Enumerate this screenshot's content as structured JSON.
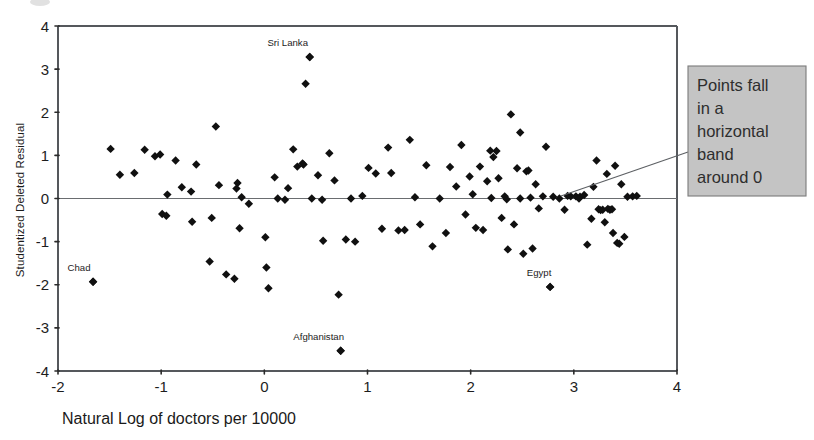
{
  "figure": {
    "background_color": "#ffffff",
    "plot_frame": {
      "left_px": 58,
      "right_px": 677,
      "top_px": 26,
      "bottom_px": 371
    }
  },
  "annotation": {
    "name": "callout-note",
    "lines": [
      "Points fall",
      "in a",
      "horizontal",
      "band",
      "around 0"
    ],
    "text": "Points fall in a horizontal band around 0",
    "box_fill": "#c4c4c4",
    "box_border": "#7b7b7b",
    "box": {
      "x": 688,
      "y": 66,
      "width": 118,
      "height": 130
    },
    "leader_from": {
      "x": 688,
      "y": 152
    },
    "leader_to": {
      "x": 561,
      "y": 196
    }
  },
  "chart_data": {
    "type": "scatter",
    "title": "",
    "xlabel": "Natural Log of doctors per 10000",
    "ylabel": "Studentized Deleted Residual",
    "xlim": [
      -2,
      4
    ],
    "ylim": [
      -4,
      4
    ],
    "xticks": [
      -2,
      -1,
      0,
      1,
      2,
      3,
      4
    ],
    "xticklabels": [
      "-2",
      "-1",
      "0",
      "1",
      "2",
      "3",
      "4"
    ],
    "yticks": [
      -4,
      -3,
      -2,
      -1,
      0,
      1,
      2,
      3,
      4
    ],
    "yticklabels": [
      "-4",
      "-3",
      "-2",
      "-1",
      "0",
      "1",
      "2",
      "3",
      "4"
    ],
    "grid": false,
    "legend": null,
    "reference_lines": [
      {
        "name": "zero-residual-line",
        "orientation": "horizontal",
        "y": 0
      }
    ],
    "marker": {
      "shape": "diamond",
      "color": "#101010",
      "size_px": 4.2
    },
    "point_labels": [
      {
        "label": "Sri Lanka",
        "x": 0.44,
        "y": 3.28,
        "dx": -22,
        "dy": -11
      },
      {
        "label": "Chad",
        "x": -1.66,
        "y": -1.93,
        "dx": -14,
        "dy": -11
      },
      {
        "label": "Afghanistan",
        "x": 0.74,
        "y": -3.53,
        "dx": -22,
        "dy": -11
      },
      {
        "label": "Egypt",
        "x": 2.77,
        "y": -2.05,
        "dx": -11,
        "dy": -11
      }
    ],
    "points": [
      [
        -1.66,
        -1.93
      ],
      [
        -1.49,
        1.15
      ],
      [
        -1.4,
        0.55
      ],
      [
        -1.26,
        0.59
      ],
      [
        -1.16,
        1.13
      ],
      [
        -1.06,
        0.98
      ],
      [
        -1.01,
        1.02
      ],
      [
        -0.99,
        -0.36
      ],
      [
        -0.95,
        -0.4
      ],
      [
        -0.94,
        0.09
      ],
      [
        -0.86,
        0.88
      ],
      [
        -0.8,
        0.26
      ],
      [
        -0.71,
        0.16
      ],
      [
        -0.7,
        -0.54
      ],
      [
        -0.66,
        0.79
      ],
      [
        -0.53,
        -1.46
      ],
      [
        -0.51,
        -0.45
      ],
      [
        -0.47,
        1.67
      ],
      [
        -0.44,
        0.31
      ],
      [
        -0.37,
        -1.76
      ],
      [
        -0.29,
        -1.86
      ],
      [
        -0.27,
        0.23
      ],
      [
        -0.26,
        0.36
      ],
      [
        -0.24,
        -0.69
      ],
      [
        -0.22,
        0.03
      ],
      [
        -0.15,
        -0.12
      ],
      [
        0.01,
        -0.9
      ],
      [
        0.02,
        -1.6
      ],
      [
        0.04,
        -2.08
      ],
      [
        0.1,
        0.49
      ],
      [
        0.13,
        0.0
      ],
      [
        0.2,
        -0.03
      ],
      [
        0.23,
        0.24
      ],
      [
        0.28,
        1.14
      ],
      [
        0.32,
        0.74
      ],
      [
        0.37,
        0.81
      ],
      [
        0.38,
        0.79
      ],
      [
        0.4,
        2.66
      ],
      [
        0.44,
        3.28
      ],
      [
        0.46,
        0.0
      ],
      [
        0.52,
        0.54
      ],
      [
        0.56,
        -0.03
      ],
      [
        0.57,
        -0.98
      ],
      [
        0.63,
        1.05
      ],
      [
        0.68,
        0.42
      ],
      [
        0.72,
        -2.23
      ],
      [
        0.74,
        -3.53
      ],
      [
        0.79,
        -0.95
      ],
      [
        0.84,
        0.0
      ],
      [
        0.88,
        -1.0
      ],
      [
        0.95,
        0.06
      ],
      [
        1.01,
        0.71
      ],
      [
        1.08,
        0.58
      ],
      [
        1.14,
        -0.7
      ],
      [
        1.2,
        1.18
      ],
      [
        1.23,
        0.59
      ],
      [
        1.3,
        -0.74
      ],
      [
        1.36,
        -0.73
      ],
      [
        1.41,
        1.36
      ],
      [
        1.46,
        0.03
      ],
      [
        1.51,
        -0.6
      ],
      [
        1.57,
        0.77
      ],
      [
        1.63,
        -1.11
      ],
      [
        1.7,
        0.0
      ],
      [
        1.76,
        -0.8
      ],
      [
        1.8,
        0.73
      ],
      [
        1.86,
        0.28
      ],
      [
        1.91,
        1.24
      ],
      [
        1.95,
        -0.37
      ],
      [
        1.99,
        0.51
      ],
      [
        2.02,
        0.1
      ],
      [
        2.05,
        -0.68
      ],
      [
        2.09,
        0.74
      ],
      [
        2.12,
        -0.73
      ],
      [
        2.16,
        0.4
      ],
      [
        2.19,
        1.11
      ],
      [
        2.22,
        0.96
      ],
      [
        2.25,
        1.1
      ],
      [
        2.27,
        0.47
      ],
      [
        2.3,
        -0.45
      ],
      [
        2.33,
        0.05
      ],
      [
        2.36,
        -1.18
      ],
      [
        2.39,
        1.95
      ],
      [
        2.42,
        -0.6
      ],
      [
        2.45,
        0.7
      ],
      [
        2.48,
        1.53
      ],
      [
        2.51,
        -1.28
      ],
      [
        2.54,
        0.63
      ],
      [
        2.56,
        0.65
      ],
      [
        2.6,
        -1.16
      ],
      [
        2.63,
        0.33
      ],
      [
        2.66,
        -0.23
      ],
      [
        2.7,
        0.05
      ],
      [
        2.73,
        1.2
      ],
      [
        2.77,
        -2.05
      ],
      [
        2.8,
        0.04
      ],
      [
        2.86,
        0.0
      ],
      [
        2.91,
        -0.26
      ],
      [
        2.97,
        0.05
      ],
      [
        3.02,
        0.05
      ],
      [
        3.06,
        0.04
      ],
      [
        3.1,
        0.08
      ],
      [
        3.13,
        -1.07
      ],
      [
        3.17,
        -0.47
      ],
      [
        3.19,
        0.27
      ],
      [
        3.22,
        0.88
      ],
      [
        3.24,
        -0.25
      ],
      [
        3.26,
        -0.27
      ],
      [
        3.28,
        -0.26
      ],
      [
        3.3,
        -0.55
      ],
      [
        3.32,
        0.57
      ],
      [
        3.33,
        -0.24
      ],
      [
        3.35,
        -0.26
      ],
      [
        3.37,
        -0.25
      ],
      [
        3.38,
        -0.8
      ],
      [
        3.4,
        0.76
      ],
      [
        3.42,
        -1.03
      ],
      [
        3.44,
        -1.05
      ],
      [
        3.46,
        0.33
      ],
      [
        3.49,
        -0.89
      ],
      [
        3.52,
        0.04
      ],
      [
        3.57,
        0.05
      ],
      [
        3.61,
        0.06
      ],
      [
        2.48,
        0.0
      ],
      [
        2.58,
        0.02
      ],
      [
        2.94,
        0.06
      ],
      [
        3.05,
        0.0
      ],
      [
        2.35,
        -0.02
      ],
      [
        2.2,
        0.01
      ]
    ]
  }
}
